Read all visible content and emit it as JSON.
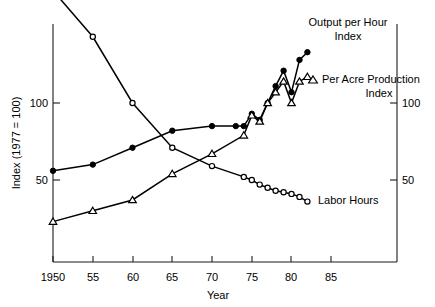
{
  "chart_data": {
    "type": "line",
    "title": "",
    "xlabel": "Year",
    "ylabel": "Index (1977 = 100)",
    "ylabel_right": "",
    "xlim": [
      1950,
      1886
    ],
    "x_axis_range": [
      1950,
      1987
    ],
    "ylim": [
      18,
      173
    ],
    "grid": false,
    "legend_position": "inline-right",
    "xticks": [
      1950,
      1955,
      1960,
      1965,
      1970,
      1975,
      1980,
      1985
    ],
    "xtick_labels": [
      "1950",
      "55",
      "60",
      "65",
      "70",
      "75",
      "80",
      "85"
    ],
    "yticks": [
      50,
      100
    ],
    "ytick_labels": [
      "50",
      "100"
    ],
    "yticks_right": [
      50,
      100
    ],
    "ytick_labels_right": [
      "50",
      "100"
    ],
    "series": [
      {
        "name": "Labor Hours",
        "marker": "open-circle",
        "label": "Labor Hours",
        "x": [
          1950,
          1955,
          1960,
          1965,
          1970,
          1974,
          1975,
          1976,
          1977,
          1978,
          1979,
          1980,
          1981,
          1982
        ],
        "values": [
          173,
          143,
          100,
          71,
          59,
          52,
          50,
          47,
          45,
          43,
          42,
          41,
          39,
          36
        ]
      },
      {
        "name": "Output per Hour Index",
        "marker": "filled-circle",
        "label": "Output per Hour\nIndex",
        "x": [
          1950,
          1955,
          1960,
          1965,
          1970,
          1973,
          1974,
          1975,
          1976,
          1977,
          1978,
          1979,
          1980,
          1981,
          1982
        ],
        "values": [
          56,
          60,
          71,
          82,
          85,
          85,
          85,
          93,
          89,
          100,
          111,
          121,
          107,
          128,
          133
        ]
      },
      {
        "name": "Per Acre Production Index",
        "marker": "open-triangle",
        "label": "Per Acre Production\nIndex",
        "x": [
          1950,
          1955,
          1960,
          1965,
          1970,
          1974,
          1975,
          1976,
          1977,
          1978,
          1979,
          1980,
          1981,
          1982
        ],
        "values": [
          23,
          30,
          37,
          54,
          67,
          79,
          92,
          88,
          100,
          107,
          114,
          100,
          114,
          117
        ]
      }
    ],
    "series_labels": {
      "output_per_hour_line1": "Output per Hour",
      "output_per_hour_line2": "Index",
      "per_acre_line1": "Per Acre Production",
      "per_acre_line2": "Index",
      "labor_hours": "Labor Hours"
    },
    "colors": {
      "line": "#000000",
      "marker_fill_open": "#ffffff",
      "axis": "#1a1a1a",
      "background": "#ffffff"
    }
  }
}
